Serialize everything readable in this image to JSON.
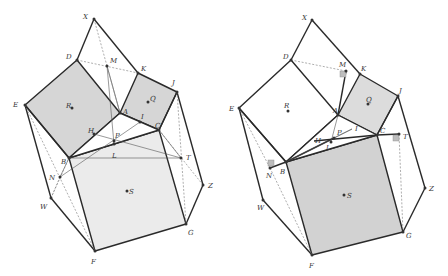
{
  "figure": {
    "colors": {
      "edge": "#2a2a2a",
      "fill_left_small": "#d6d6d6",
      "fill_left_big": "#ebebeb",
      "fill_right_small": "#dcdcdc",
      "fill_right_big": "#d2d2d2",
      "right_angle_marker": "#bdbdbd"
    },
    "left": {
      "points": {
        "X": [
          94,
          19
        ],
        "D": [
          77,
          60
        ],
        "M": [
          107,
          66
        ],
        "K": [
          138,
          73
        ],
        "J": [
          177,
          92
        ],
        "E": [
          25,
          105
        ],
        "R": [
          72,
          108
        ],
        "Q": [
          148,
          102
        ],
        "A": [
          120,
          113
        ],
        "I": [
          140,
          122
        ],
        "C": [
          159,
          130
        ],
        "H": [
          94,
          134
        ],
        "P": [
          114,
          141
        ],
        "L": [
          114,
          144
        ],
        "B": [
          69,
          158
        ],
        "T": [
          181,
          158
        ],
        "N": [
          60,
          177
        ],
        "Z": [
          203,
          185
        ],
        "S": [
          127,
          191
        ],
        "W": [
          51,
          198
        ],
        "G": [
          186,
          224
        ],
        "F": [
          95,
          251
        ]
      },
      "labels": [
        {
          "t": "X",
          "x": 83,
          "y": 19
        },
        {
          "t": "D",
          "x": 66,
          "y": 59
        },
        {
          "t": "M",
          "x": 110,
          "y": 63
        },
        {
          "t": "K",
          "x": 141,
          "y": 71
        },
        {
          "t": "J",
          "x": 172,
          "y": 85
        },
        {
          "t": "E",
          "x": 13,
          "y": 107
        },
        {
          "t": "R",
          "x": 66,
          "y": 108
        },
        {
          "t": "Q",
          "x": 150,
          "y": 101
        },
        {
          "t": "A",
          "x": 123,
          "y": 114
        },
        {
          "t": "I",
          "x": 141,
          "y": 119
        },
        {
          "t": "C",
          "x": 155,
          "y": 128
        },
        {
          "t": "H",
          "x": 88,
          "y": 133
        },
        {
          "t": "P",
          "x": 115,
          "y": 138
        },
        {
          "t": "L",
          "x": 112,
          "y": 158
        },
        {
          "t": "B",
          "x": 61,
          "y": 164
        },
        {
          "t": "T",
          "x": 186,
          "y": 160
        },
        {
          "t": "N",
          "x": 49,
          "y": 180
        },
        {
          "t": "Z",
          "x": 208,
          "y": 188
        },
        {
          "t": "S",
          "x": 129,
          "y": 194
        },
        {
          "t": "W",
          "x": 40,
          "y": 209
        },
        {
          "t": "G",
          "x": 188,
          "y": 235
        },
        {
          "t": "F",
          "x": 91,
          "y": 264
        }
      ]
    },
    "right": {
      "points": {
        "X": [
          312,
          20
        ],
        "D": [
          291,
          60
        ],
        "M": [
          346,
          71
        ],
        "K": [
          360,
          74
        ],
        "J": [
          398,
          96
        ],
        "E": [
          239,
          108
        ],
        "R": [
          288,
          111
        ],
        "Q": [
          368,
          104
        ],
        "A": [
          338,
          115
        ],
        "P": [
          334,
          138
        ],
        "I": [
          352,
          129
        ],
        "C": [
          377,
          135
        ],
        "T": [
          399,
          134
        ],
        "H": [
          314,
          141
        ],
        "L": [
          331,
          142
        ],
        "B": [
          286,
          162
        ],
        "N": [
          270,
          168
        ],
        "Z": [
          425,
          188
        ],
        "S": [
          344,
          195
        ],
        "W": [
          263,
          200
        ],
        "G": [
          403,
          232
        ],
        "F": [
          312,
          255
        ]
      },
      "labels": [
        {
          "t": "X",
          "x": 302,
          "y": 20
        },
        {
          "t": "D",
          "x": 283,
          "y": 59
        },
        {
          "t": "M",
          "x": 339,
          "y": 67
        },
        {
          "t": "K",
          "x": 361,
          "y": 71
        },
        {
          "t": "J",
          "x": 399,
          "y": 93
        },
        {
          "t": "E",
          "x": 229,
          "y": 111
        },
        {
          "t": "R",
          "x": 284,
          "y": 108
        },
        {
          "t": "Q",
          "x": 366,
          "y": 102
        },
        {
          "t": "A",
          "x": 333,
          "y": 113
        },
        {
          "t": "P",
          "x": 337,
          "y": 135
        },
        {
          "t": "I",
          "x": 355,
          "y": 131
        },
        {
          "t": "C",
          "x": 380,
          "y": 133
        },
        {
          "t": "T",
          "x": 403,
          "y": 139
        },
        {
          "t": "H",
          "x": 315,
          "y": 143
        },
        {
          "t": "L",
          "x": 326,
          "y": 150
        },
        {
          "t": "B",
          "x": 280,
          "y": 174
        },
        {
          "t": "N",
          "x": 266,
          "y": 178
        },
        {
          "t": "Z",
          "x": 429,
          "y": 191
        },
        {
          "t": "S",
          "x": 347,
          "y": 198
        },
        {
          "t": "W",
          "x": 257,
          "y": 210
        },
        {
          "t": "G",
          "x": 406,
          "y": 238
        },
        {
          "t": "F",
          "x": 309,
          "y": 268
        }
      ]
    }
  }
}
